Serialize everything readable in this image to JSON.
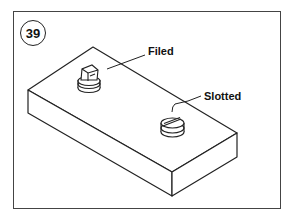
{
  "figure": {
    "number": "39",
    "labels": {
      "filed": "Filed",
      "slotted": "Slotted"
    }
  },
  "colors": {
    "line": "#222222",
    "frame": "#444444",
    "background": "#ffffff"
  }
}
